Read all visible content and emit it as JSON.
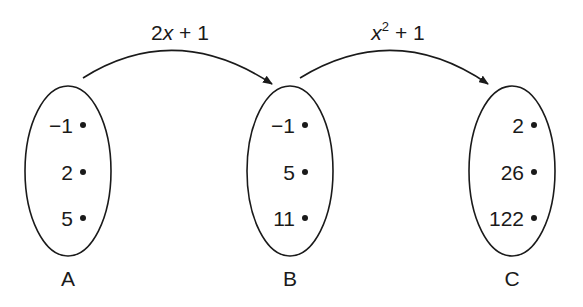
{
  "diagram": {
    "sets": [
      {
        "label": "A",
        "values": [
          "−1",
          "2",
          "5"
        ]
      },
      {
        "label": "B",
        "values": [
          "−1",
          "5",
          "11"
        ]
      },
      {
        "label": "C",
        "values": [
          "2",
          "26",
          "122"
        ]
      }
    ],
    "mappings": [
      {
        "from": "A",
        "to": "B",
        "var": "2x",
        "rest": " + 1",
        "coef": "2",
        "x": "x",
        "tail": " + 1"
      },
      {
        "from": "B",
        "to": "C",
        "x": "x",
        "exp": "2",
        "tail": " + 1"
      }
    ],
    "colors": {
      "stroke": "#1a1a1a",
      "background": "#ffffff"
    }
  }
}
